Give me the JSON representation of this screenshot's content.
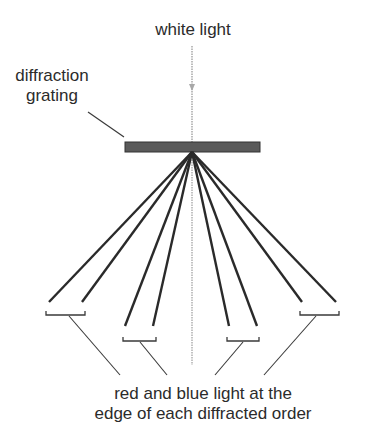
{
  "diagram": {
    "title": "white light",
    "grating_label_line1": "diffraction",
    "grating_label_line2": "grating",
    "caption_line1": "red and blue light at the",
    "caption_line2": "edge of each diffracted order",
    "colors": {
      "grating_fill": "#5a5a5a",
      "grating_border": "#333333",
      "ray": "#2a2a2a",
      "incident_light": "#a8a8a8",
      "leader": "#3a3a3a"
    },
    "elements": {
      "grating": {
        "x": 125,
        "y": 142,
        "width": 135,
        "height": 10
      },
      "source_point": {
        "x": 192,
        "y": 152
      },
      "diffracted_orders": [
        {
          "name": "order-left-outer",
          "rays_end_x": [
            49,
            82
          ],
          "end_y": 302,
          "bracket": [
            46,
            85,
            315
          ]
        },
        {
          "name": "order-left-inner",
          "rays_end_x": [
            125,
            153
          ],
          "end_y": 326,
          "bracket": [
            123,
            156,
            341
          ]
        },
        {
          "name": "order-right-inner",
          "rays_end_x": [
            229,
            257
          ],
          "end_y": 326,
          "bracket": [
            227,
            259,
            341
          ]
        },
        {
          "name": "order-right-outer",
          "rays_end_x": [
            302,
            336
          ],
          "end_y": 302,
          "bracket": [
            300,
            339,
            315
          ]
        }
      ]
    }
  }
}
